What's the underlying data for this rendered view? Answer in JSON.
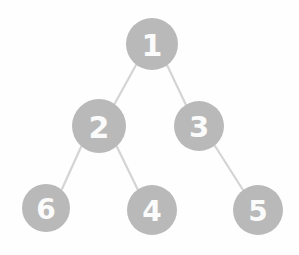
{
  "diagram": {
    "type": "binary-tree",
    "background_color": "#fefefe",
    "node_fill_color": "#b9b9b9",
    "node_label_color": "#fbfbfb",
    "edge_color": "#d4d4d4",
    "nodes": [
      {
        "id": "node-1",
        "label": "1",
        "cx": 152,
        "cy": 44,
        "r": 26,
        "font_size": 30
      },
      {
        "id": "node-2",
        "label": "2",
        "cx": 99,
        "cy": 126,
        "r": 27,
        "font_size": 30
      },
      {
        "id": "node-3",
        "label": "3",
        "cx": 199,
        "cy": 126,
        "r": 25,
        "font_size": 29
      },
      {
        "id": "node-6",
        "label": "6",
        "cx": 46,
        "cy": 208,
        "r": 24,
        "font_size": 28
      },
      {
        "id": "node-4",
        "label": "4",
        "cx": 152,
        "cy": 210,
        "r": 25,
        "font_size": 28
      },
      {
        "id": "node-5",
        "label": "5",
        "cx": 258,
        "cy": 210,
        "r": 25,
        "font_size": 28
      }
    ],
    "edges": [
      {
        "id": "edge-1-2",
        "from": "node-1",
        "to": "node-2",
        "x1": 136,
        "y1": 65,
        "x2": 114,
        "y2": 105
      },
      {
        "id": "edge-1-3",
        "from": "node-1",
        "to": "node-3",
        "x1": 167,
        "y1": 65,
        "x2": 186,
        "y2": 105
      },
      {
        "id": "edge-2-6",
        "from": "node-2",
        "to": "node-6",
        "x1": 81,
        "y1": 147,
        "x2": 62,
        "y2": 189
      },
      {
        "id": "edge-2-4",
        "from": "node-2",
        "to": "node-4",
        "x1": 117,
        "y1": 147,
        "x2": 138,
        "y2": 190
      },
      {
        "id": "edge-3-5",
        "from": "node-3",
        "to": "node-5",
        "x1": 215,
        "y1": 146,
        "x2": 243,
        "y2": 190
      }
    ]
  }
}
